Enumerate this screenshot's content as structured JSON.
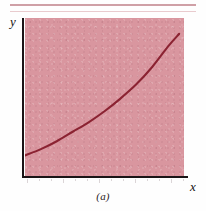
{
  "figure": {
    "caption": "(a)",
    "panel_letter": "a",
    "y_axis_label": "y",
    "x_axis_label": "x",
    "colors": {
      "plot_background": "#d9969f",
      "curve": "#8b2332",
      "axis": "#1a1416",
      "page_background": "#fefefe",
      "rule": "#cfa0a6"
    }
  },
  "chart_data": {
    "type": "line",
    "title": "",
    "subtitle": "",
    "xlabel": "x",
    "ylabel": "y",
    "caption": "(a)",
    "grid": false,
    "legend": null,
    "legend_position": "none",
    "axis_ticks": {
      "x": [],
      "y": []
    },
    "xlim": [
      0,
      1
    ],
    "ylim": [
      0,
      1
    ],
    "series": [
      {
        "name": "convex increasing curve",
        "color": "#8b2332",
        "shape": "monotonic increasing, convex (upward curving)",
        "x": [
          0.0,
          0.1,
          0.2,
          0.3,
          0.4,
          0.5,
          0.6,
          0.7,
          0.8,
          0.9,
          0.97
        ],
        "y": [
          0.13,
          0.17,
          0.22,
          0.28,
          0.34,
          0.41,
          0.49,
          0.58,
          0.69,
          0.82,
          0.9
        ]
      }
    ],
    "annotations": []
  }
}
